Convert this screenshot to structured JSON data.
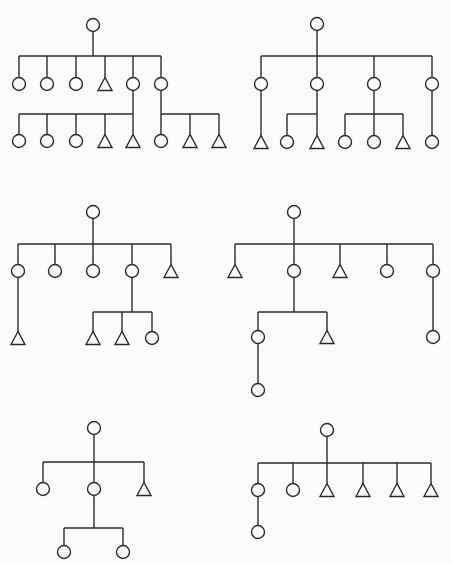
{
  "style": {
    "stroke": "#2b2b2b",
    "background": "#fbfbf9",
    "circle_radius": 6.5,
    "triangle_half_width": 7,
    "triangle_height": 13
  },
  "legend": {
    "circle": "circle-node",
    "triangle": "triangle-node"
  },
  "trees": [
    {
      "id": "tree-1",
      "nodes": [
        {
          "id": "r",
          "shape": "circle",
          "x": 93,
          "y": 25
        },
        {
          "id": "a1",
          "shape": "circle",
          "x": 19,
          "y": 84,
          "parent": "r"
        },
        {
          "id": "a2",
          "shape": "circle",
          "x": 47,
          "y": 84,
          "parent": "r"
        },
        {
          "id": "a3",
          "shape": "circle",
          "x": 76,
          "y": 84,
          "parent": "r"
        },
        {
          "id": "a4",
          "shape": "triangle",
          "x": 105,
          "y": 84,
          "parent": "r"
        },
        {
          "id": "a5",
          "shape": "circle",
          "x": 133,
          "y": 84,
          "parent": "r"
        },
        {
          "id": "a6",
          "shape": "circle",
          "x": 161,
          "y": 84,
          "parent": "r"
        },
        {
          "id": "b1",
          "shape": "circle",
          "x": 19,
          "y": 141,
          "parent": "a5"
        },
        {
          "id": "b2",
          "shape": "circle",
          "x": 47,
          "y": 141,
          "parent": "a5"
        },
        {
          "id": "b3",
          "shape": "circle",
          "x": 76,
          "y": 141,
          "parent": "a5"
        },
        {
          "id": "b4",
          "shape": "triangle",
          "x": 105,
          "y": 141,
          "parent": "a5"
        },
        {
          "id": "b5",
          "shape": "triangle",
          "x": 133,
          "y": 141,
          "parent": "a5"
        },
        {
          "id": "b6",
          "shape": "circle",
          "x": 161,
          "y": 141,
          "parent": "a6"
        },
        {
          "id": "b7",
          "shape": "triangle",
          "x": 190,
          "y": 141,
          "parent": "a6"
        },
        {
          "id": "b8",
          "shape": "triangle",
          "x": 219,
          "y": 141,
          "parent": "a6"
        }
      ],
      "bars": [
        {
          "parent": "r",
          "y": 56
        },
        {
          "parent": "a5",
          "y": 114
        },
        {
          "parent": "a6",
          "y": 114
        }
      ]
    },
    {
      "id": "tree-2",
      "nodes": [
        {
          "id": "r",
          "shape": "circle",
          "x": 317,
          "y": 24
        },
        {
          "id": "a1",
          "shape": "circle",
          "x": 261,
          "y": 84,
          "parent": "r"
        },
        {
          "id": "a2",
          "shape": "circle",
          "x": 317,
          "y": 84,
          "parent": "r"
        },
        {
          "id": "a3",
          "shape": "circle",
          "x": 374,
          "y": 84,
          "parent": "r"
        },
        {
          "id": "a4",
          "shape": "circle",
          "x": 432,
          "y": 84,
          "parent": "r"
        },
        {
          "id": "b1",
          "shape": "triangle",
          "x": 261,
          "y": 142,
          "parent": "a1"
        },
        {
          "id": "b2",
          "shape": "circle",
          "x": 287,
          "y": 142,
          "parent": "a2"
        },
        {
          "id": "b3",
          "shape": "triangle",
          "x": 317,
          "y": 142,
          "parent": "a2"
        },
        {
          "id": "b4",
          "shape": "circle",
          "x": 345,
          "y": 142,
          "parent": "a3"
        },
        {
          "id": "b5",
          "shape": "circle",
          "x": 374,
          "y": 142,
          "parent": "a3"
        },
        {
          "id": "b6",
          "shape": "triangle",
          "x": 403,
          "y": 142,
          "parent": "a3"
        },
        {
          "id": "b7",
          "shape": "circle",
          "x": 432,
          "y": 142,
          "parent": "a4"
        }
      ],
      "bars": [
        {
          "parent": "r",
          "y": 56
        },
        {
          "parent": "a2",
          "y": 114
        },
        {
          "parent": "a3",
          "y": 114
        }
      ]
    },
    {
      "id": "tree-3",
      "nodes": [
        {
          "id": "r",
          "shape": "circle",
          "x": 93,
          "y": 212
        },
        {
          "id": "a1",
          "shape": "circle",
          "x": 18,
          "y": 271,
          "parent": "r"
        },
        {
          "id": "a2",
          "shape": "circle",
          "x": 55,
          "y": 271,
          "parent": "r"
        },
        {
          "id": "a3",
          "shape": "circle",
          "x": 93,
          "y": 271,
          "parent": "r"
        },
        {
          "id": "a4",
          "shape": "circle",
          "x": 132,
          "y": 271,
          "parent": "r"
        },
        {
          "id": "a5",
          "shape": "triangle",
          "x": 171,
          "y": 271,
          "parent": "r"
        },
        {
          "id": "b1",
          "shape": "triangle",
          "x": 18,
          "y": 338,
          "parent": "a1"
        },
        {
          "id": "b2",
          "shape": "triangle",
          "x": 93,
          "y": 338,
          "parent": "a4"
        },
        {
          "id": "b3",
          "shape": "triangle",
          "x": 122,
          "y": 338,
          "parent": "a4"
        },
        {
          "id": "b4",
          "shape": "circle",
          "x": 152,
          "y": 338,
          "parent": "a4"
        }
      ],
      "bars": [
        {
          "parent": "r",
          "y": 244
        },
        {
          "parent": "a4",
          "y": 312
        }
      ]
    },
    {
      "id": "tree-4",
      "nodes": [
        {
          "id": "r",
          "shape": "circle",
          "x": 294,
          "y": 212
        },
        {
          "id": "a1",
          "shape": "triangle",
          "x": 235,
          "y": 271,
          "parent": "r"
        },
        {
          "id": "a2",
          "shape": "circle",
          "x": 294,
          "y": 271,
          "parent": "r"
        },
        {
          "id": "a3",
          "shape": "triangle",
          "x": 340,
          "y": 271,
          "parent": "r"
        },
        {
          "id": "a4",
          "shape": "circle",
          "x": 387,
          "y": 271,
          "parent": "r"
        },
        {
          "id": "a5",
          "shape": "circle",
          "x": 433,
          "y": 271,
          "parent": "r"
        },
        {
          "id": "b1",
          "shape": "circle",
          "x": 258,
          "y": 337,
          "parent": "a2"
        },
        {
          "id": "b2",
          "shape": "triangle",
          "x": 327,
          "y": 337,
          "parent": "a2"
        },
        {
          "id": "b3",
          "shape": "circle",
          "x": 433,
          "y": 337,
          "parent": "a5"
        },
        {
          "id": "c1",
          "shape": "circle",
          "x": 258,
          "y": 390,
          "parent": "b1"
        }
      ],
      "bars": [
        {
          "parent": "r",
          "y": 244
        },
        {
          "parent": "a2",
          "y": 312
        }
      ]
    },
    {
      "id": "tree-5",
      "nodes": [
        {
          "id": "r",
          "shape": "circle",
          "x": 94,
          "y": 428
        },
        {
          "id": "a1",
          "shape": "circle",
          "x": 43,
          "y": 489,
          "parent": "r"
        },
        {
          "id": "a2",
          "shape": "circle",
          "x": 94,
          "y": 489,
          "parent": "r"
        },
        {
          "id": "a3",
          "shape": "triangle",
          "x": 144,
          "y": 489,
          "parent": "r"
        },
        {
          "id": "b1",
          "shape": "circle",
          "x": 64,
          "y": 552,
          "parent": "a2"
        },
        {
          "id": "b2",
          "shape": "circle",
          "x": 123,
          "y": 552,
          "parent": "a2"
        }
      ],
      "bars": [
        {
          "parent": "r",
          "y": 462
        },
        {
          "parent": "a2",
          "y": 528
        }
      ]
    },
    {
      "id": "tree-6",
      "nodes": [
        {
          "id": "r",
          "shape": "circle",
          "x": 327,
          "y": 430
        },
        {
          "id": "a1",
          "shape": "circle",
          "x": 258,
          "y": 490,
          "parent": "r"
        },
        {
          "id": "a2",
          "shape": "circle",
          "x": 293,
          "y": 490,
          "parent": "r"
        },
        {
          "id": "a3",
          "shape": "triangle",
          "x": 327,
          "y": 490,
          "parent": "r"
        },
        {
          "id": "a4",
          "shape": "triangle",
          "x": 363,
          "y": 490,
          "parent": "r"
        },
        {
          "id": "a5",
          "shape": "triangle",
          "x": 397,
          "y": 490,
          "parent": "r"
        },
        {
          "id": "a6",
          "shape": "triangle",
          "x": 431,
          "y": 490,
          "parent": "r"
        },
        {
          "id": "b1",
          "shape": "circle",
          "x": 258,
          "y": 532,
          "parent": "a1"
        }
      ],
      "bars": [
        {
          "parent": "r",
          "y": 463
        }
      ]
    }
  ]
}
